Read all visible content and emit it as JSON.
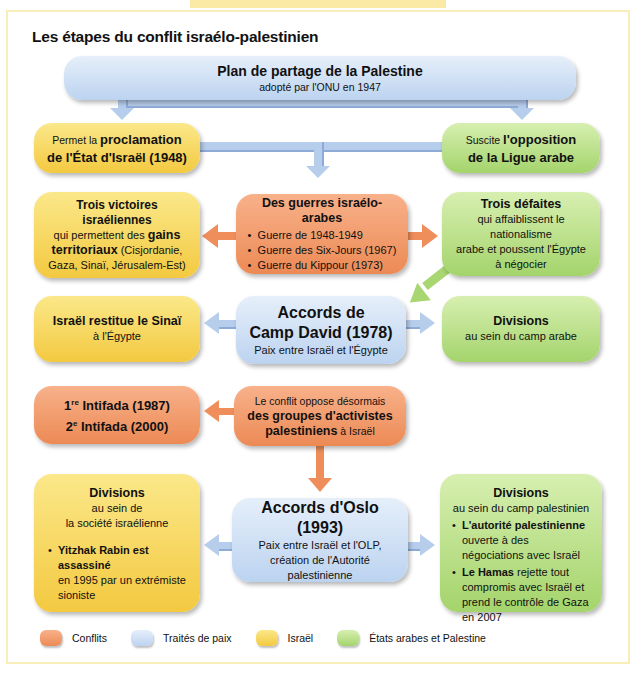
{
  "title": "Les étapes du conflit israélo-palestinien",
  "colors": {
    "conflits": "#ec8a55",
    "traites": "#bcd3f0",
    "israel": "#f3c940",
    "arabes": "#a4d46c"
  },
  "nodes": {
    "plan": {
      "title": "Plan de partage de la Palestine",
      "sub": "adopté par l'ONU en 1947"
    },
    "proclamation": {
      "pre": "Permet la ",
      "bold1": "proclamation",
      "bold2": "de l'État d'Israël (1948)"
    },
    "opposition": {
      "pre": "Suscite ",
      "bold1": "l'opposition",
      "bold2": "de la Ligue arabe"
    },
    "victoires": {
      "title": "Trois victoires israéliennes",
      "l1a": "qui permettent des ",
      "l1b": "gains",
      "l2a": "territoriaux",
      "l2b": " (Cisjordanie,",
      "l3": "Gaza, Sinaï, Jérusalem-Est)"
    },
    "guerres": {
      "title": "Des guerres israélo-arabes",
      "items": [
        "Guerre de 1948-1949",
        "Guerre des Six-Jours (1967)",
        "Guerre du Kippour (1973)"
      ]
    },
    "defaites": {
      "title": "Trois défaites",
      "l1": "qui affaiblissent le nationalisme",
      "l2": "arabe et poussent l'Égypte",
      "l3": "à négocier"
    },
    "sinai": {
      "title": "Israël restitue le Sinaï",
      "sub": "à l'Égypte"
    },
    "campdavid": {
      "t1": "Accords de",
      "t2": "Camp David (1978)",
      "sub": "Paix entre Israël et l'Égypte"
    },
    "divisions_arabe": {
      "title": "Divisions",
      "sub": "au sein du camp arabe"
    },
    "intifada": {
      "l1n": "1",
      "l1s": "re",
      "l1t": " Intifada (1987)",
      "l2n": "2",
      "l2s": "e",
      "l2t": " Intifada (2000)"
    },
    "activistes": {
      "l1": "Le conflit oppose désormais",
      "l2": "des groupes d'activistes",
      "l3b": "palestiniens",
      "l3": " à Israël"
    },
    "divisions_israel": {
      "title": "Divisions",
      "s1": "au sein de",
      "s2": "la société israélienne",
      "b_bold": "Yitzhak Rabin est assassiné",
      "b_rest": "en 1995 par un extrémiste sioniste"
    },
    "oslo": {
      "t1": "Accords d'Oslo",
      "t2": "(1993)",
      "s1": "Paix entre Israël et l'OLP,",
      "s2": "création de l'Autorité palestinienne"
    },
    "divisions_pal": {
      "title": "Divisions",
      "sub": "au sein du camp palestinien",
      "b1_bold": "L'autorité palestinienne",
      "b1_rest": "ouverte à des négociations avec Israël",
      "b2_bold": "Le Hamas",
      "b2_rest": " rejette tout compromis avec Israël et prend le contrôle de Gaza en 2007"
    }
  },
  "legend": [
    {
      "label": "Conflits",
      "color": "#ec8a55"
    },
    {
      "label": "Traités de paix",
      "color": "#bcd3f0"
    },
    {
      "label": "Israël",
      "color": "#f3c940"
    },
    {
      "label": "États arabes et Palestine",
      "color": "#a4d46c"
    }
  ]
}
